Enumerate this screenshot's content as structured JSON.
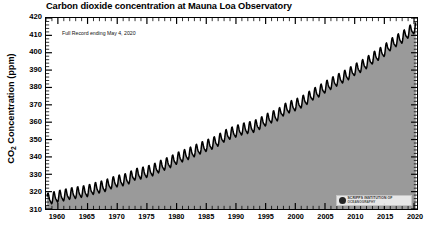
{
  "chart_data": {
    "type": "area",
    "title": "Carbon dioxide concentration at Mauna Loa Observatory",
    "subtitle": "Full Record ending May 4, 2020",
    "xlabel": "",
    "ylabel": "CO2 Concentration (ppm)",
    "ylabel_prefix": "CO",
    "ylabel_sub": "2",
    "ylabel_suffix": " Concentration (ppm)",
    "xlim": [
      1958,
      2020.5
    ],
    "ylim": [
      310,
      420
    ],
    "y_ticks": [
      310,
      320,
      330,
      340,
      350,
      360,
      370,
      380,
      390,
      400,
      410,
      420
    ],
    "x_ticks": [
      1960,
      1965,
      1970,
      1975,
      1980,
      1985,
      1990,
      1995,
      2000,
      2005,
      2010,
      2015,
      2020
    ],
    "x_minor_tick_interval": 1,
    "y_minor_tick_interval": 2,
    "grid": false,
    "legend": null,
    "fill_color": "#9a9a9a",
    "line_color": "#000000",
    "seasonal_amplitude_ppm": 6.0,
    "series": [
      {
        "name": "Monthly mean CO2 (Keeling Curve)",
        "annual_means": [
          {
            "year": 1958,
            "value": 315.3
          },
          {
            "year": 1959,
            "value": 315.98
          },
          {
            "year": 1960,
            "value": 316.91
          },
          {
            "year": 1961,
            "value": 317.64
          },
          {
            "year": 1962,
            "value": 318.45
          },
          {
            "year": 1963,
            "value": 318.99
          },
          {
            "year": 1964,
            "value": 319.62
          },
          {
            "year": 1965,
            "value": 320.04
          },
          {
            "year": 1966,
            "value": 321.38
          },
          {
            "year": 1967,
            "value": 322.16
          },
          {
            "year": 1968,
            "value": 323.04
          },
          {
            "year": 1969,
            "value": 324.62
          },
          {
            "year": 1970,
            "value": 325.68
          },
          {
            "year": 1971,
            "value": 326.32
          },
          {
            "year": 1972,
            "value": 327.45
          },
          {
            "year": 1973,
            "value": 329.68
          },
          {
            "year": 1974,
            "value": 330.18
          },
          {
            "year": 1975,
            "value": 331.11
          },
          {
            "year": 1976,
            "value": 332.04
          },
          {
            "year": 1977,
            "value": 333.83
          },
          {
            "year": 1978,
            "value": 335.4
          },
          {
            "year": 1979,
            "value": 336.84
          },
          {
            "year": 1980,
            "value": 338.75
          },
          {
            "year": 1981,
            "value": 340.11
          },
          {
            "year": 1982,
            "value": 341.45
          },
          {
            "year": 1983,
            "value": 343.05
          },
          {
            "year": 1984,
            "value": 344.65
          },
          {
            "year": 1985,
            "value": 346.12
          },
          {
            "year": 1986,
            "value": 347.42
          },
          {
            "year": 1987,
            "value": 349.19
          },
          {
            "year": 1988,
            "value": 351.57
          },
          {
            "year": 1989,
            "value": 353.12
          },
          {
            "year": 1990,
            "value": 354.39
          },
          {
            "year": 1991,
            "value": 355.61
          },
          {
            "year": 1992,
            "value": 356.45
          },
          {
            "year": 1993,
            "value": 357.1
          },
          {
            "year": 1994,
            "value": 358.83
          },
          {
            "year": 1995,
            "value": 360.82
          },
          {
            "year": 1996,
            "value": 362.61
          },
          {
            "year": 1997,
            "value": 363.73
          },
          {
            "year": 1998,
            "value": 366.7
          },
          {
            "year": 1999,
            "value": 368.38
          },
          {
            "year": 2000,
            "value": 369.55
          },
          {
            "year": 2001,
            "value": 371.14
          },
          {
            "year": 2002,
            "value": 373.28
          },
          {
            "year": 2003,
            "value": 375.8
          },
          {
            "year": 2004,
            "value": 377.52
          },
          {
            "year": 2005,
            "value": 379.8
          },
          {
            "year": 2006,
            "value": 381.9
          },
          {
            "year": 2007,
            "value": 383.79
          },
          {
            "year": 2008,
            "value": 385.6
          },
          {
            "year": 2009,
            "value": 387.43
          },
          {
            "year": 2010,
            "value": 389.9
          },
          {
            "year": 2011,
            "value": 391.65
          },
          {
            "year": 2012,
            "value": 393.85
          },
          {
            "year": 2013,
            "value": 396.52
          },
          {
            "year": 2014,
            "value": 398.65
          },
          {
            "year": 2015,
            "value": 400.83
          },
          {
            "year": 2016,
            "value": 404.24
          },
          {
            "year": 2017,
            "value": 406.55
          },
          {
            "year": 2018,
            "value": 408.52
          },
          {
            "year": 2019,
            "value": 411.44
          },
          {
            "year": 2020,
            "value": 414.0
          }
        ],
        "start_value": 315.3,
        "end_value": 417.1,
        "peak_value": 417.1
      }
    ]
  },
  "logo": {
    "line1": "SCRIPPS INSTITUTION OF",
    "line2": "OCEANOGRAPHY",
    "mark": "scripps-circle-icon"
  }
}
